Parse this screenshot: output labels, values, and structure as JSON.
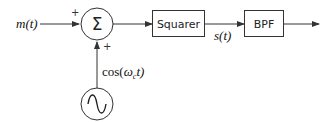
{
  "diagram": {
    "input_label": "m(t)",
    "sum_symbol": "Σ",
    "sum_signs": {
      "top": "+",
      "bottom": "+"
    },
    "carrier_label": "cos(ωct)",
    "carrier_parts": {
      "prefix": "cos(",
      "omega": "ω",
      "sub": "c",
      "suffix": "t)"
    },
    "oscillator_symbol": "~",
    "blocks": [
      {
        "id": "squarer",
        "label": "Squarer"
      },
      {
        "id": "bpf",
        "label": "BPF"
      }
    ],
    "intermediate_label": "s(t)",
    "colors": {
      "line": "#333333",
      "background": "#ffffff"
    }
  }
}
